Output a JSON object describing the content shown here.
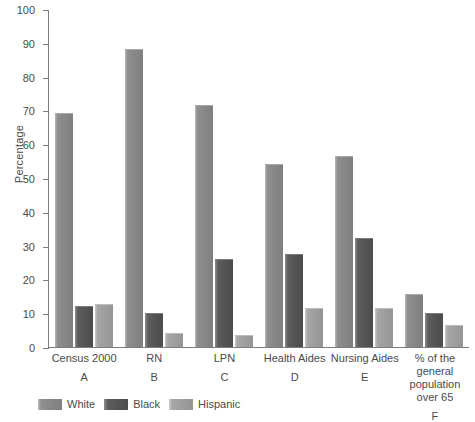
{
  "chart_data": {
    "type": "bar",
    "title": "",
    "xlabel": "",
    "ylabel": "Percentage",
    "ylim": [
      0,
      100
    ],
    "yticks": [
      0,
      10,
      20,
      30,
      40,
      50,
      60,
      70,
      80,
      90,
      100
    ],
    "grid": false,
    "legend_position": "bottom-left",
    "categories": [
      "Census 2000",
      "RN",
      "LPN",
      "Health Aides",
      "Nursing Aides",
      "% of the general population over 65"
    ],
    "category_letters": [
      "A",
      "B",
      "C",
      "D",
      "E",
      "F"
    ],
    "category_lines": [
      [
        "Census 2000"
      ],
      [
        "RN"
      ],
      [
        "LPN"
      ],
      [
        "Health Aides"
      ],
      [
        "Nursing Aides"
      ],
      [
        "% of the",
        "general",
        "population",
        "over 65"
      ]
    ],
    "series": [
      {
        "name": "White",
        "color": "#878787",
        "values": [
          69.2,
          88.3,
          71.6,
          54.2,
          56.4,
          15.6
        ]
      },
      {
        "name": "Black",
        "color": "#545454",
        "values": [
          12.2,
          10.0,
          26.1,
          27.6,
          32.4,
          10.0
        ]
      },
      {
        "name": "Hispanic",
        "color": "#9e9e9e",
        "values": [
          12.8,
          4.0,
          3.6,
          11.5,
          11.6,
          6.6
        ]
      }
    ]
  }
}
